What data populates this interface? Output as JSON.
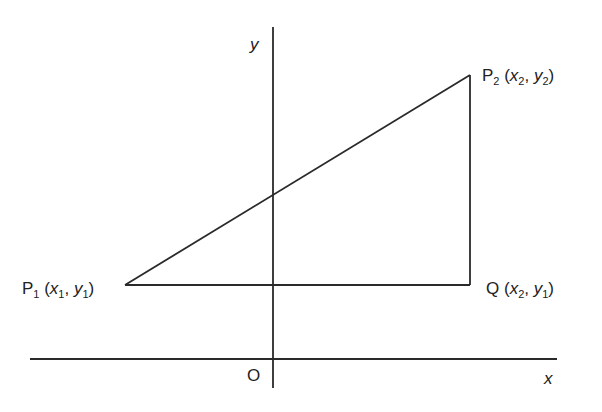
{
  "diagram": {
    "axes": {
      "x_label": "x",
      "y_label": "y",
      "origin_label": "O"
    },
    "points": {
      "P1": {
        "name": "P",
        "sub": "1",
        "coord": [
          "x",
          "1",
          "y",
          "1"
        ]
      },
      "P2": {
        "name": "P",
        "sub": "2",
        "coord": [
          "x",
          "2",
          "y",
          "2"
        ]
      },
      "Q": {
        "name": "Q",
        "sub": "",
        "coord": [
          "x",
          "2",
          "y",
          "1"
        ]
      }
    },
    "shapes": [
      {
        "type": "line",
        "from": "P1",
        "to": "P2",
        "description": "hypotenuse"
      },
      {
        "type": "line",
        "from": "P1",
        "to": "Q",
        "description": "horizontal leg"
      },
      {
        "type": "line",
        "from": "Q",
        "to": "P2",
        "description": "vertical leg"
      }
    ],
    "colors": {
      "stroke": "#2a2a2a",
      "text": "#222222",
      "background": "#ffffff"
    }
  }
}
